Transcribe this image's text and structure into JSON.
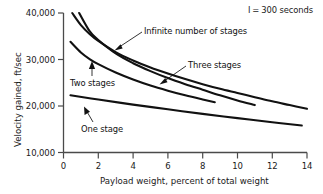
{
  "chart_data": {
    "type": "line",
    "title": "",
    "xlabel": "Payload weight, percent of total weight",
    "ylabel": "Velocity gained, ft/sec",
    "xlim": [
      0,
      14
    ],
    "ylim": [
      10000,
      40000
    ],
    "xticks": [
      "0",
      "2",
      "4",
      "6",
      "8",
      "10",
      "12",
      "14"
    ],
    "xtick_values": [
      0,
      2,
      4,
      6,
      8,
      10,
      12,
      14
    ],
    "yticks": [
      "10,000",
      "20,000",
      "30,000",
      "40,000"
    ],
    "ytick_values": [
      10000,
      20000,
      30000,
      40000
    ],
    "grid": false,
    "legend_position": "inline-annotations",
    "annotations": [
      {
        "name": "specific-impulse-note",
        "text": "I = 300 seconds",
        "symbol": "I",
        "separator": "=",
        "value": "300 seconds",
        "position": "top-right"
      }
    ],
    "series": [
      {
        "name": "Infinite number of stages",
        "label": "Infinite number of stages",
        "x": [
          0.5,
          1.0,
          1.5,
          2.0,
          3.0,
          4.0,
          5.0,
          6.0,
          7.0,
          8.0,
          9.0,
          10.0,
          11.0,
          12.0,
          13.0,
          14.0
        ],
        "y": [
          40000,
          37400,
          35500,
          34000,
          31600,
          29800,
          28300,
          27000,
          25800,
          24700,
          23700,
          22800,
          21900,
          21000,
          20200,
          19400
        ]
      },
      {
        "name": "Three stages",
        "label": "Three stages",
        "x": [
          0.9,
          1.5,
          2.0,
          3.0,
          4.0,
          5.0,
          6.0,
          7.0,
          8.0,
          9.0,
          10.0,
          11.0
        ],
        "y": [
          40000,
          36100,
          34200,
          31300,
          29200,
          27500,
          26000,
          24700,
          23500,
          22300,
          21200,
          20200
        ]
      },
      {
        "name": "Two stages",
        "label": "Two stages",
        "x": [
          0.4,
          1.0,
          1.5,
          2.0,
          3.0,
          4.0,
          5.0,
          6.0,
          7.0,
          8.0,
          8.7
        ],
        "y": [
          33800,
          31500,
          30100,
          29000,
          27200,
          25700,
          24400,
          23300,
          22300,
          21400,
          20800
        ]
      },
      {
        "name": "One stage",
        "label": "One stage",
        "x": [
          0.4,
          2.0,
          4.0,
          6.0,
          8.0,
          10.0,
          12.0,
          13.7
        ],
        "y": [
          22300,
          21400,
          20300,
          19300,
          18300,
          17400,
          16500,
          15800
        ]
      }
    ]
  },
  "labels": {
    "infinite_stages": "Infinite number of stages",
    "three_stages": "Three stages",
    "two_stages": "Two stages",
    "one_stage": "One stage",
    "impulse_symbol": "I",
    "impulse_equals": "=",
    "impulse_value": "300 seconds"
  }
}
